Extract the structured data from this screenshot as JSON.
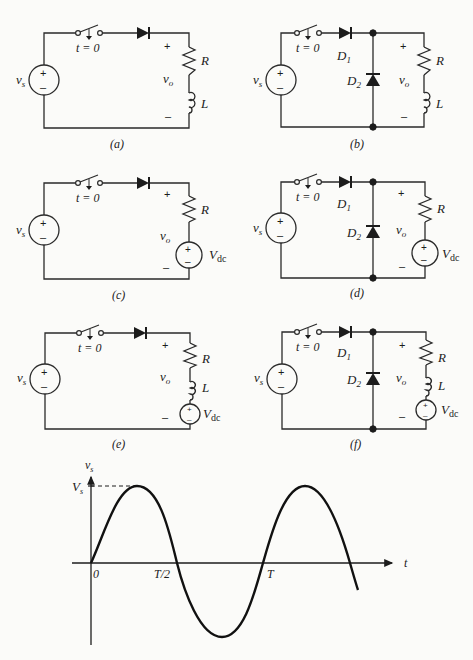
{
  "figure": {
    "panels": [
      {
        "id": "a",
        "caption": "(a)",
        "switch_label": "t = 0",
        "source_label": "vs",
        "output_label": "vo",
        "plus": "+",
        "minus": "–",
        "components": [
          "R",
          "L"
        ],
        "diodes": []
      },
      {
        "id": "b",
        "caption": "(b)",
        "switch_label": "t = 0",
        "source_label": "vs",
        "output_label": "vo",
        "plus": "+",
        "minus": "–",
        "components": [
          "R",
          "L"
        ],
        "diodes": [
          "D1",
          "D2"
        ]
      },
      {
        "id": "c",
        "caption": "(c)",
        "switch_label": "t = 0",
        "source_label": "vs",
        "output_label": "vo",
        "plus": "+",
        "minus": "–",
        "components": [
          "R",
          "Vdc"
        ],
        "diodes": []
      },
      {
        "id": "d",
        "caption": "(d)",
        "switch_label": "t = 0",
        "source_label": "vs",
        "output_label": "vo",
        "plus": "+",
        "minus": "–",
        "components": [
          "R",
          "Vdc"
        ],
        "diodes": [
          "D1",
          "D2"
        ]
      },
      {
        "id": "e",
        "caption": "(e)",
        "switch_label": "t = 0",
        "source_label": "vs",
        "output_label": "vo",
        "plus": "+",
        "minus": "–",
        "components": [
          "R",
          "L",
          "Vdc"
        ],
        "diodes": []
      },
      {
        "id": "f",
        "caption": "(f)",
        "switch_label": "t = 0",
        "source_label": "vs",
        "output_label": "vo",
        "plus": "+",
        "minus": "–",
        "components": [
          "R",
          "L",
          "Vdc"
        ],
        "diodes": [
          "D1",
          "D2"
        ]
      }
    ],
    "labels": {
      "R": "R",
      "L": "L",
      "V": "V",
      "dc": "dc",
      "D": "D",
      "one": "1",
      "two": "2",
      "v": "v",
      "s": "s",
      "o": "o",
      "t0": "t = 0",
      "plus": "+",
      "minus": "–"
    },
    "waveform": {
      "y_axis_label": "vs",
      "peak_label": "Vs",
      "x_axis_label": "t",
      "ticks": [
        "0",
        "T/2",
        "T"
      ]
    }
  }
}
